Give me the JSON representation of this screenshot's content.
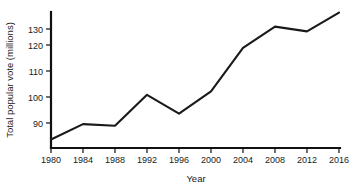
{
  "chart_data": {
    "type": "line",
    "title": "",
    "xlabel": "Year",
    "ylabel": "Total popular vote (millions)",
    "x": [
      1980,
      1984,
      1988,
      1992,
      1996,
      2000,
      2004,
      2008,
      2012,
      2016
    ],
    "values": [
      83,
      89.5,
      88.8,
      102,
      94,
      103.5,
      122,
      131,
      129,
      137
    ],
    "series": [
      {
        "name": "Total popular vote",
        "values": [
          83,
          89.5,
          88.8,
          102,
          94,
          103.5,
          122,
          131,
          129,
          137
        ]
      }
    ],
    "xtick_labels": [
      "1980",
      "1984",
      "1988",
      "1992",
      "1996",
      "2000",
      "2004",
      "2008",
      "2012",
      "2016"
    ],
    "ytick_labels": [
      "90",
      "100",
      "110",
      "120",
      "130"
    ],
    "yticks": [
      90,
      100,
      110,
      120,
      130
    ],
    "xlim": [
      1980,
      2016
    ],
    "ylim": [
      80,
      140
    ],
    "grid": false,
    "legend": false,
    "line_color": "#1a1a1a",
    "axis_color": "#111111",
    "background_color": "#ffffff"
  }
}
